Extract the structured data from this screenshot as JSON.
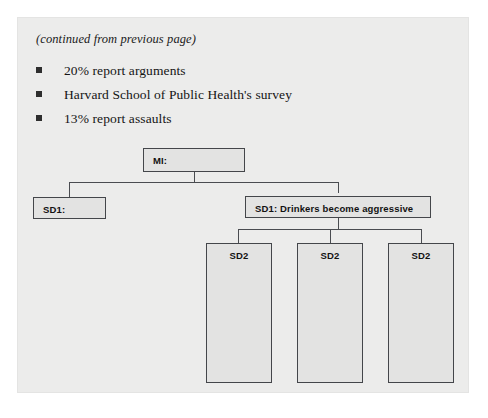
{
  "slide": {
    "continued_note": "(continued from previous page)",
    "bullets": [
      {
        "marker": "square-bullet",
        "text": "20% report arguments"
      },
      {
        "marker": "square-bullet",
        "text": "Harvard School of Public Health's survey"
      },
      {
        "marker": "square-bullet",
        "text": "13% report assaults"
      }
    ]
  },
  "diagram": {
    "type": "hierarchy-tree",
    "root": {
      "label": "MI:"
    },
    "level1": [
      {
        "label": "SD1:"
      },
      {
        "label": "SD1: Drinkers become aggressive"
      }
    ],
    "level2": [
      {
        "label": "SD2"
      },
      {
        "label": "SD2"
      },
      {
        "label": "SD2"
      }
    ]
  },
  "colors": {
    "panel_background": "#ececeb",
    "node_fill": "#e3e3e2",
    "node_border": "#44464a",
    "connector": "#4a4c50",
    "text": "#121212"
  }
}
